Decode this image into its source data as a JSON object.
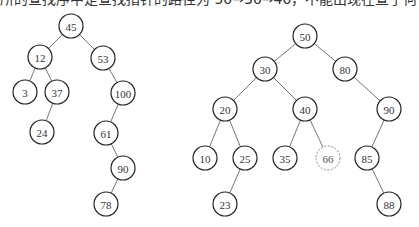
{
  "caption": "所的查找序中是查找指针的路径为 50→30→40，不能出现在查于何子。",
  "trees": [
    {
      "name": "left-tree",
      "nodes": [
        {
          "id": "n45",
          "label": "45",
          "x": 71,
          "y": 26
        },
        {
          "id": "n12",
          "label": "12",
          "x": 40,
          "y": 57
        },
        {
          "id": "n53",
          "label": "53",
          "x": 103,
          "y": 58
        },
        {
          "id": "n3",
          "label": "3",
          "x": 25,
          "y": 92
        },
        {
          "id": "n37",
          "label": "37",
          "x": 57,
          "y": 92
        },
        {
          "id": "n100",
          "label": "100",
          "x": 123,
          "y": 93
        },
        {
          "id": "n24",
          "label": "24",
          "x": 42,
          "y": 132
        },
        {
          "id": "n61",
          "label": "61",
          "x": 106,
          "y": 133
        },
        {
          "id": "n90",
          "label": "90",
          "x": 123,
          "y": 168
        },
        {
          "id": "n78",
          "label": "78",
          "x": 106,
          "y": 204
        }
      ],
      "edges": [
        [
          "n45",
          "n12"
        ],
        [
          "n45",
          "n53"
        ],
        [
          "n12",
          "n3"
        ],
        [
          "n12",
          "n37"
        ],
        [
          "n37",
          "n24"
        ],
        [
          "n53",
          "n100"
        ],
        [
          "n100",
          "n61"
        ],
        [
          "n61",
          "n90"
        ],
        [
          "n90",
          "n78"
        ]
      ]
    },
    {
      "name": "right-tree",
      "nodes": [
        {
          "id": "r50",
          "label": "50",
          "x": 305,
          "y": 36
        },
        {
          "id": "r30",
          "label": "30",
          "x": 265,
          "y": 69
        },
        {
          "id": "r80",
          "label": "80",
          "x": 345,
          "y": 69
        },
        {
          "id": "r20",
          "label": "20",
          "x": 225,
          "y": 109
        },
        {
          "id": "r40",
          "label": "40",
          "x": 305,
          "y": 109
        },
        {
          "id": "r90",
          "label": "90",
          "x": 389,
          "y": 109
        },
        {
          "id": "r10",
          "label": "10",
          "x": 205,
          "y": 158
        },
        {
          "id": "r25",
          "label": "25",
          "x": 245,
          "y": 158
        },
        {
          "id": "r35",
          "label": "35",
          "x": 285,
          "y": 158
        },
        {
          "id": "r66",
          "label": "66",
          "x": 328,
          "y": 158,
          "dashed": true
        },
        {
          "id": "r85",
          "label": "85",
          "x": 367,
          "y": 158
        },
        {
          "id": "r23",
          "label": "23",
          "x": 225,
          "y": 204
        },
        {
          "id": "r88",
          "label": "88",
          "x": 389,
          "y": 204
        }
      ],
      "edges": [
        [
          "r50",
          "r30"
        ],
        [
          "r50",
          "r80"
        ],
        [
          "r30",
          "r20"
        ],
        [
          "r30",
          "r40"
        ],
        [
          "r20",
          "r10"
        ],
        [
          "r20",
          "r25"
        ],
        [
          "r25",
          "r23"
        ],
        [
          "r40",
          "r35"
        ],
        [
          "r40",
          "r66"
        ],
        [
          "r80",
          "r90"
        ],
        [
          "r90",
          "r85"
        ],
        [
          "r85",
          "r88"
        ]
      ]
    }
  ],
  "node_radius": 12
}
